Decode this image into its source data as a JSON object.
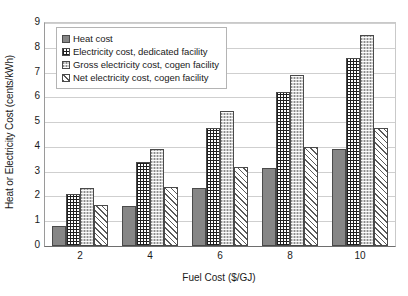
{
  "chart_data": {
    "type": "bar",
    "title": "",
    "xlabel": "Fuel Cost ($/GJ)",
    "ylabel": "Heat or Electricity Cost (cents/kWh)",
    "categories": [
      "2",
      "4",
      "6",
      "8",
      "10"
    ],
    "ylim": [
      0,
      9
    ],
    "yticks": [
      "0",
      "1",
      "2",
      "3",
      "4",
      "5",
      "6",
      "7",
      "8",
      "9"
    ],
    "grid": true,
    "legend_position": "top-left-inside",
    "series": [
      {
        "name": "Heat cost",
        "values": [
          0.8,
          1.6,
          2.35,
          3.15,
          3.9
        ]
      },
      {
        "name": "Electricity cost, dedicated facility",
        "values": [
          2.1,
          3.4,
          4.75,
          6.2,
          7.6
        ]
      },
      {
        "name": "Gross electricity cost, cogen facility",
        "values": [
          2.35,
          3.9,
          5.45,
          6.9,
          8.5
        ]
      },
      {
        "name": "Net electricity cost, cogen facility",
        "values": [
          1.65,
          2.4,
          3.2,
          4.0,
          4.75
        ]
      }
    ]
  }
}
